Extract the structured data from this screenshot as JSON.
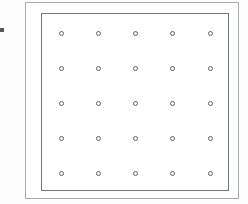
{
  "diagram": {
    "canvas": {
      "width": 248,
      "height": 204,
      "background": "#fdfdfd"
    },
    "edge_tick": {
      "name": "left-edge-tick-mark",
      "x": 0,
      "y": 28,
      "width": 4,
      "height": 4,
      "color": "#555a5e"
    },
    "outer_frame": {
      "label": "outer border",
      "x": 25,
      "y": 2,
      "width": 214,
      "height": 197,
      "stroke": "#a8abae",
      "stroke_width": 1,
      "fill": "#ffffff"
    },
    "inner_frame": {
      "label": "inner border",
      "x": 41,
      "y": 13,
      "width": 188,
      "height": 178,
      "stroke": "#75797d",
      "stroke_width": 1,
      "fill": "#ffffff"
    },
    "grid": {
      "label": "hole grid",
      "rows": 5,
      "columns": 5,
      "count": 25,
      "marker": "ring",
      "marker_diameter": 5,
      "marker_stroke": "#5e6367",
      "marker_fill": "#fbfbfb",
      "column_x": [
        61,
        98,
        135,
        172,
        210
      ],
      "row_y": [
        33,
        68,
        103,
        138,
        173
      ],
      "points": [
        {
          "col": 1,
          "row": 1,
          "x": 61,
          "y": 33
        },
        {
          "col": 2,
          "row": 1,
          "x": 98,
          "y": 33
        },
        {
          "col": 3,
          "row": 1,
          "x": 135,
          "y": 33
        },
        {
          "col": 4,
          "row": 1,
          "x": 172,
          "y": 33
        },
        {
          "col": 5,
          "row": 1,
          "x": 210,
          "y": 33
        },
        {
          "col": 1,
          "row": 2,
          "x": 61,
          "y": 68
        },
        {
          "col": 2,
          "row": 2,
          "x": 98,
          "y": 68
        },
        {
          "col": 3,
          "row": 2,
          "x": 135,
          "y": 68
        },
        {
          "col": 4,
          "row": 2,
          "x": 172,
          "y": 68
        },
        {
          "col": 5,
          "row": 2,
          "x": 210,
          "y": 68
        },
        {
          "col": 1,
          "row": 3,
          "x": 61,
          "y": 103
        },
        {
          "col": 2,
          "row": 3,
          "x": 98,
          "y": 103
        },
        {
          "col": 3,
          "row": 3,
          "x": 135,
          "y": 103
        },
        {
          "col": 4,
          "row": 3,
          "x": 172,
          "y": 103
        },
        {
          "col": 5,
          "row": 3,
          "x": 210,
          "y": 103
        },
        {
          "col": 1,
          "row": 4,
          "x": 61,
          "y": 138
        },
        {
          "col": 2,
          "row": 4,
          "x": 98,
          "y": 138
        },
        {
          "col": 3,
          "row": 4,
          "x": 135,
          "y": 138
        },
        {
          "col": 4,
          "row": 4,
          "x": 172,
          "y": 138
        },
        {
          "col": 5,
          "row": 4,
          "x": 210,
          "y": 138
        },
        {
          "col": 1,
          "row": 5,
          "x": 61,
          "y": 173
        },
        {
          "col": 2,
          "row": 5,
          "x": 98,
          "y": 173
        },
        {
          "col": 3,
          "row": 5,
          "x": 135,
          "y": 173
        },
        {
          "col": 4,
          "row": 5,
          "x": 172,
          "y": 173
        },
        {
          "col": 5,
          "row": 5,
          "x": 210,
          "y": 173
        }
      ]
    }
  }
}
